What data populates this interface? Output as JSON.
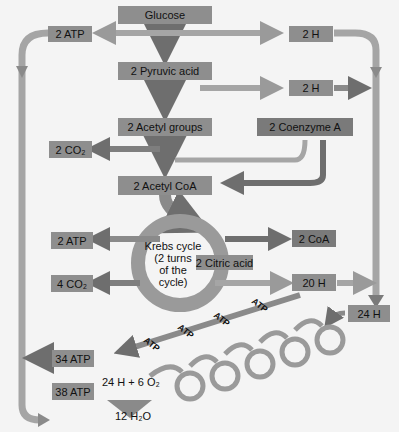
{
  "diagram": {
    "nodes": {
      "glucose": "Glucose",
      "pyruvic": "2 Pyruvic acid",
      "acetyl_groups": "2 Acetyl groups",
      "coenzyme_a": "2 Coenzyme A",
      "acetyl_coa": "2 Acetyl CoA",
      "atp_top": "2 ATP",
      "h_top": "2 H",
      "h_second": "2 H",
      "co2_top": "2 CO₂",
      "atp_krebs": "2 ATP",
      "coa_out": "2 CoA",
      "citric_acid": "2 Citric acid",
      "co2_krebs": "4 CO₂",
      "h_20": "20 H",
      "h_24": "24 H",
      "atp_34": "34 ATP",
      "atp_38": "38 ATP"
    },
    "krebs": {
      "line1": "Krebs cycle",
      "line2": "(2 turns",
      "line3": "of the",
      "line4": "cycle)"
    },
    "etc": {
      "atp_labels": [
        "ATP",
        "ATP",
        "ATP",
        "ATP"
      ],
      "equation": "24 H  +  6 O₂",
      "product": "12 H₂O"
    },
    "colors": {
      "box": "#8e8e8e",
      "arrow": "#9a9a9a",
      "arrow_dark": "#6e6e6e",
      "background": "#f4f4f4"
    }
  }
}
